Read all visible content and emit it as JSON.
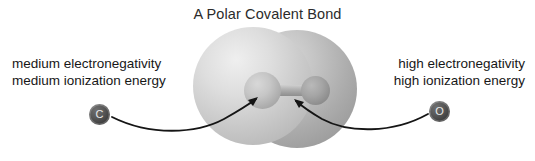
{
  "figure": {
    "title": "A Polar Covalent Bond",
    "background_color": "#ffffff"
  },
  "labels": {
    "left": {
      "line1": "medium electronegativity",
      "line2": "medium ionization energy"
    },
    "right": {
      "line1": "high electronegativity",
      "line2": "high ionization energy"
    }
  },
  "atoms": {
    "left": {
      "symbol": "C",
      "marker_color": "#4a4a4a",
      "marker_text_color": "#e8e8e8"
    },
    "right": {
      "symbol": "O",
      "marker_color": "#3a3a3a",
      "marker_text_color": "#e8e8e8"
    }
  },
  "molecule": {
    "cloud_description": "two-lobed electron density cloud",
    "cloud_color_left": "#d2d2d2",
    "cloud_color_right": "#b0b0b0",
    "inner_atom_left_color": "#c6c6c6",
    "inner_atom_right_color": "#9e9e9e",
    "bond_color": "#b0b0b0"
  },
  "annotations": {
    "arrow_left": "arrow from C marker to left inner atom",
    "arrow_right": "arrow from O marker to right inner atom",
    "arrow_color": "#1a1a1a"
  }
}
